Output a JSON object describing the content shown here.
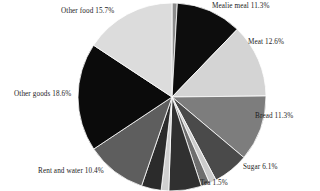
{
  "chart_data": {
    "type": "pie",
    "title": "",
    "subtitle": "",
    "xlabel": "",
    "ylabel": "",
    "grid": false,
    "legend": "none",
    "label_format": "{name} {value}%",
    "note_top_label_cropped": true,
    "categories": [
      "Mealie meal",
      "Meat",
      "Bread",
      "Sugar",
      "Tea",
      "Rent and water",
      "Other goods",
      "Other food"
    ],
    "values": [
      11.3,
      12.6,
      11.3,
      6.1,
      1.5,
      10.4,
      18.6,
      15.7
    ],
    "slices": [
      {
        "name": "cropped-top-sliver",
        "value": 0.9,
        "label": "",
        "fill": "#8c8c8c",
        "labeled": false
      },
      {
        "name": "Mealie meal",
        "value": 11.3,
        "label": "Mealie meal 11.3%",
        "fill": "#0d0d0d",
        "labeled": true
      },
      {
        "name": "Meat",
        "value": 12.6,
        "label": "Meat 12.6%",
        "fill": "#d4d4d4",
        "labeled": true
      },
      {
        "name": "Bread",
        "value": 11.3,
        "label": "Bread 11.3%",
        "fill": "#7d7d7d",
        "labeled": true
      },
      {
        "name": "Sugar",
        "value": 6.1,
        "label": "Sugar 6.1%",
        "fill": "#4a4a4a",
        "labeled": true
      },
      {
        "name": "unlabeled-a",
        "value": 1.2,
        "label": "",
        "fill": "#cccccc",
        "labeled": false
      },
      {
        "name": "Tea",
        "value": 1.5,
        "label": "Tea 1.5%",
        "fill": "#6e6e6e",
        "labeled": true
      },
      {
        "name": "unlabeled-b",
        "value": 5.6,
        "label": "",
        "fill": "#303030",
        "labeled": false
      },
      {
        "name": "unlabeled-c",
        "value": 1.3,
        "label": "",
        "fill": "#d0d0d0",
        "labeled": false
      },
      {
        "name": "unlabeled-d",
        "value": 3.4,
        "label": "",
        "fill": "#2b2b2b",
        "labeled": false
      },
      {
        "name": "Rent and water",
        "value": 10.4,
        "label": "Rent and water 10.4%",
        "fill": "#5e5e5e",
        "labeled": true
      },
      {
        "name": "Other goods",
        "value": 18.6,
        "label": "Other goods 18.6%",
        "fill": "#0b0b0b",
        "labeled": true
      },
      {
        "name": "Other food",
        "value": 15.7,
        "label": "Other food 15.7%",
        "fill": "#dcdcdc",
        "labeled": true
      }
    ]
  },
  "labels": {
    "mealie_meal": "Mealie meal 11.3%",
    "meat": "Meat 12.6%",
    "bread": "Bread 11.3%",
    "sugar": "Sugar 6.1%",
    "tea": "Tea 1.5%",
    "rent_and_water": "Rent and water 10.4%",
    "other_goods": "Other goods 18.6%",
    "other_food": "Other food 15.7%"
  },
  "geometry": {
    "center_x": 172,
    "center_y": 97,
    "radius": 94,
    "start_angle_deg": -90,
    "direction": "clockwise",
    "stroke": "#ffffff",
    "stroke_width": 0.8
  }
}
